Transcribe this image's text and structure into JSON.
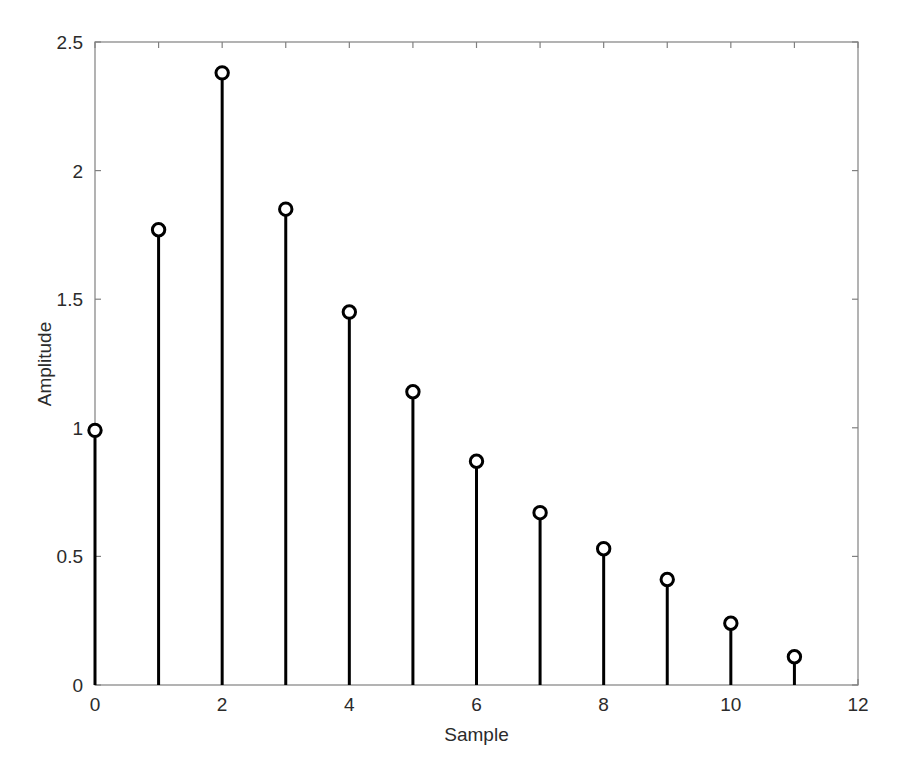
{
  "chart_data": {
    "type": "stem",
    "title": "",
    "subtitle": "",
    "xlabel": "Sample",
    "ylabel": "Amplitude",
    "x": [
      0,
      1,
      2,
      3,
      4,
      5,
      6,
      7,
      8,
      9,
      10,
      11
    ],
    "values": [
      0.99,
      1.77,
      2.38,
      1.85,
      1.45,
      1.14,
      0.87,
      0.67,
      0.53,
      0.41,
      0.24,
      0.11
    ],
    "series": [
      {
        "name": "Amplitude",
        "values": [
          0.99,
          1.77,
          2.38,
          1.85,
          1.45,
          1.14,
          0.87,
          0.67,
          0.53,
          0.41,
          0.24,
          0.11
        ]
      }
    ],
    "xlim": [
      0,
      12
    ],
    "ylim": [
      0,
      2.5
    ],
    "xticks": [
      0,
      1,
      2,
      3,
      4,
      5,
      6,
      7,
      8,
      9,
      10,
      11,
      12
    ],
    "xtick_labels": [
      "0",
      "",
      "2",
      "",
      "4",
      "",
      "6",
      "",
      "8",
      "",
      "10",
      "",
      "12"
    ],
    "yticks": [
      0,
      0.5,
      1,
      1.5,
      2,
      2.5
    ],
    "ytick_labels": [
      "0",
      "0.5",
      "1",
      "1.5",
      "2",
      "2.5"
    ],
    "grid": false,
    "legend": false,
    "legend_position": "none",
    "marker": "circle-open",
    "line_color": "#000000",
    "marker_color": "#000000",
    "axis_color": "#808080",
    "background_color": "#ffffff",
    "baseline": 0
  }
}
